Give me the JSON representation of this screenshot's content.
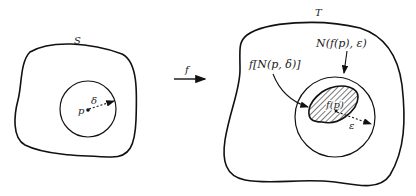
{
  "figure": {
    "left_region": {
      "set_label": "S",
      "point_label": "p",
      "radius_label": "δ"
    },
    "mapping": {
      "label": "f"
    },
    "right_region": {
      "set_label": "T",
      "neighborhood_label": "N(f(p), ε)",
      "image_label": "f[N(p, δ)]",
      "image_point_label": "f(p)",
      "radius_label": "ε"
    }
  }
}
